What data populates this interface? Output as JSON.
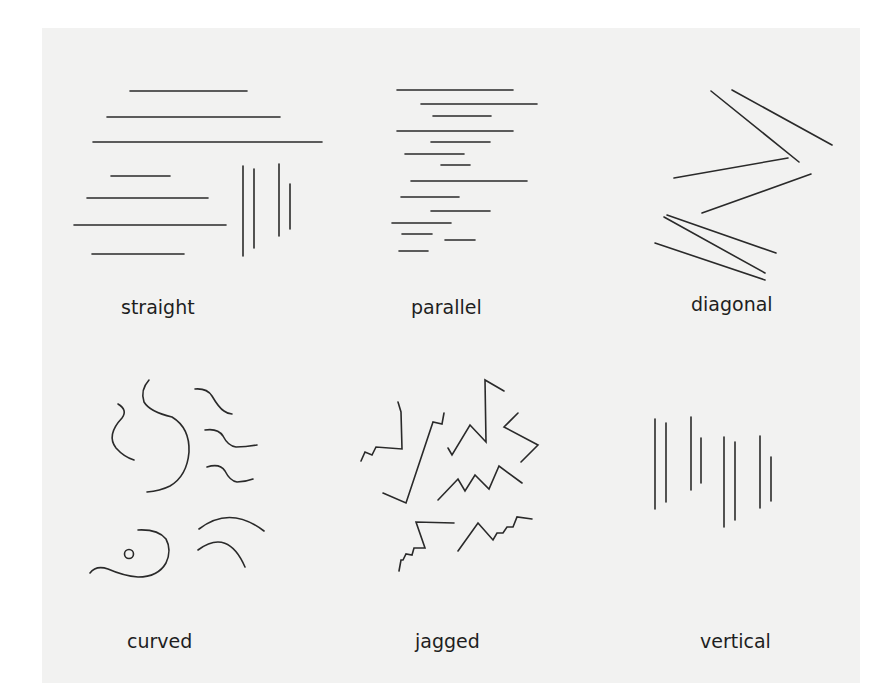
{
  "figure": {
    "background": "#f2f2f1",
    "stroke_color": "#2a2a2a",
    "panels": [
      {
        "id": "straight",
        "label": "straight"
      },
      {
        "id": "parallel",
        "label": "parallel"
      },
      {
        "id": "diagonal",
        "label": "diagonal"
      },
      {
        "id": "curved",
        "label": "curved"
      },
      {
        "id": "jagged",
        "label": "jagged"
      },
      {
        "id": "vertical",
        "label": "vertical"
      }
    ]
  }
}
